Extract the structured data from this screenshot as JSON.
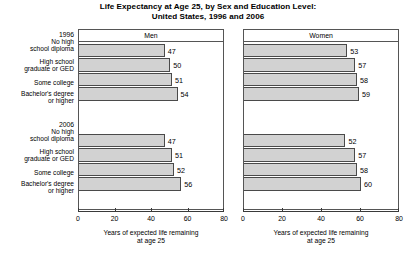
{
  "chart_data": {
    "type": "bar",
    "orientation": "horizontal",
    "title": "Life Expectancy at Age 25, by Sex and Education Level:",
    "subtitle": "United States, 1996 and 2006",
    "xlabel": "Years of expected life remaining at age 25",
    "xlabel_line1": "Years of expected life remaining",
    "xlabel_line2": "at age 25",
    "ylabel": "",
    "xlim": [
      0,
      80
    ],
    "xticks": [
      0,
      20,
      40,
      60,
      80
    ],
    "xtick_labels": [
      "0",
      "20",
      "40",
      "60",
      "80"
    ],
    "grid": false,
    "legend": false,
    "panels": [
      {
        "name": "Men",
        "groups": [
          {
            "year": "1996",
            "categories": [
              "No high school diploma",
              "High school graduate or GED",
              "Some college",
              "Bachelor's degree or higher"
            ],
            "values": [
              47,
              50,
              51,
              54
            ]
          },
          {
            "year": "2006",
            "categories": [
              "No high school diploma",
              "High school graduate or GED",
              "Some college",
              "Bachelor's degree or higher"
            ],
            "values": [
              47,
              51,
              52,
              56
            ]
          }
        ]
      },
      {
        "name": "Women",
        "groups": [
          {
            "year": "1996",
            "categories": [
              "No high school diploma",
              "High school graduate or GED",
              "Some college",
              "Bachelor's degree or higher"
            ],
            "values": [
              53,
              57,
              58,
              59
            ]
          },
          {
            "year": "2006",
            "categories": [
              "No high school diploma",
              "High school graduate or GED",
              "Some college",
              "Bachelor's degree or higher"
            ],
            "values": [
              52,
              57,
              58,
              60
            ]
          }
        ]
      }
    ],
    "bar_color": "#d2d2d2",
    "bar_edge_color": "#4a4a4a"
  },
  "row_labels": {
    "group_years": [
      "1996",
      "2006"
    ],
    "categories": [
      [
        "No high",
        "school diploma"
      ],
      [
        "High school",
        "graduate or GED"
      ],
      [
        "Some college"
      ],
      [
        "Bachelor's degree",
        "or higher"
      ]
    ]
  }
}
